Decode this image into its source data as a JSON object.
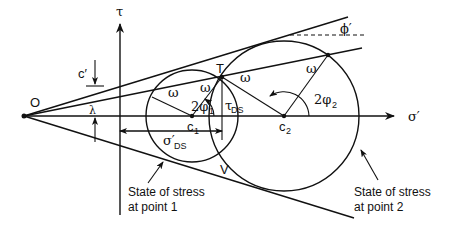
{
  "diagram": {
    "axes": {
      "vertical_label": "τ",
      "horizontal_label": "σ′"
    },
    "points": {
      "origin": "O",
      "tangent_top": "T",
      "tangent_bottom": "V",
      "center_1": "c",
      "center_1_sub": "1",
      "center_2": "c",
      "center_2_sub": "2"
    },
    "labels": {
      "cohesion": "c′",
      "lambda": "λ",
      "friction_angle": "ϕ′",
      "omega": "ω",
      "angle_1": "2φ",
      "angle_1_sub": "1",
      "angle_2": "2φ",
      "angle_2_sub": "2",
      "tau_ds": "τ",
      "tau_ds_sub": "DS",
      "sigma_ds": "σ′",
      "sigma_ds_sub": "DS"
    },
    "annotations": {
      "point1_line1": "State of stress",
      "point1_line2": "at point 1",
      "point2_line1": "State of stress",
      "point2_line2": "at point 2"
    },
    "colors": {
      "stroke": "#111111",
      "background": "#ffffff"
    }
  }
}
